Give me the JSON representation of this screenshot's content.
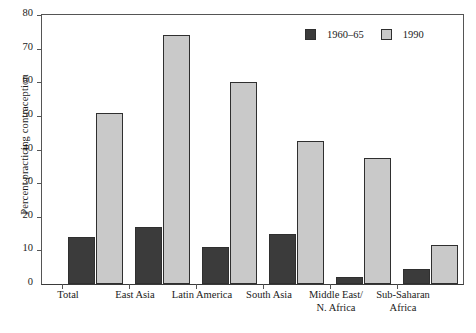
{
  "chart_data": {
    "type": "bar",
    "title": "",
    "xlabel": "",
    "ylabel": "Percent practicing contraception",
    "ylim": [
      0,
      80
    ],
    "yticks": [
      0,
      10,
      20,
      30,
      40,
      50,
      60,
      70,
      80
    ],
    "grid": false,
    "legend_position": "top-right",
    "categories": [
      "Total",
      "East Asia",
      "Latin America",
      "South Asia",
      "Middle East/\nN. Africa",
      "Sub-Saharan\nAfrica"
    ],
    "series": [
      {
        "name": "1960–65",
        "color": "#3b3b3b",
        "values": [
          14,
          17,
          11,
          15,
          2,
          4.5
        ]
      },
      {
        "name": "1990",
        "color": "#c9c9c9",
        "values": [
          51,
          74,
          60,
          42.5,
          37.5,
          11.5
        ]
      }
    ]
  },
  "axis": {
    "y_title": "Percent practicing contraception",
    "y_tick_labels": [
      "80",
      "70",
      "60",
      "50",
      "40",
      "30",
      "20",
      "10",
      "0"
    ],
    "x_tick_labels_line1": [
      "Total",
      "East Asia",
      "Latin America",
      "South Asia",
      "Middle East/",
      "Sub-Saharan"
    ],
    "x_tick_labels_line2": [
      "",
      "",
      "",
      "",
      "N. Africa",
      "Africa"
    ]
  },
  "legend": {
    "items": [
      {
        "label": "1960–65",
        "swatch": "dark-swatch-icon"
      },
      {
        "label": "1990",
        "swatch": "light-swatch-icon"
      }
    ]
  }
}
